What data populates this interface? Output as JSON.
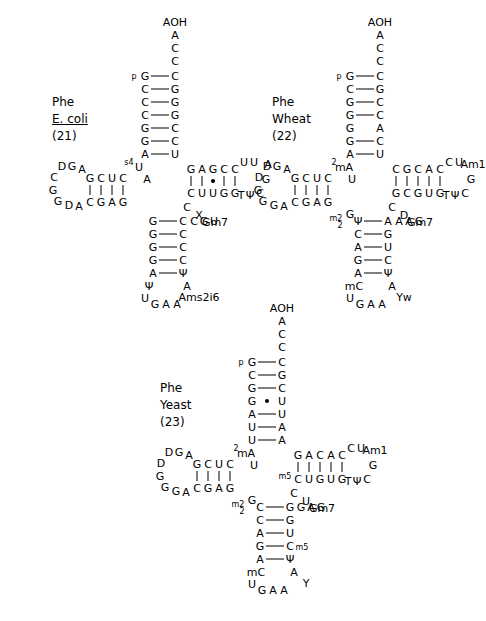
{
  "figure": {
    "panels": [
      {
        "id": "ecoli",
        "label_lines": [
          "Phe",
          "E. coli",
          "(21)"
        ],
        "label_underline_index": 1,
        "number": "(21)",
        "acceptor_end": "AOH",
        "acceptor_5p_tag": "p",
        "acceptor_stem_5p": [
          "G",
          "C",
          "C",
          "C",
          "G",
          "G",
          "A"
        ],
        "acceptor_stem_3p": [
          "C",
          "G",
          "G",
          "G",
          "C",
          "C",
          "U"
        ],
        "acceptor_single_3p": [
          "A",
          "C",
          "C"
        ],
        "acceptor_pair_marks": [
          "-",
          "-",
          "-",
          "-",
          "-",
          "-",
          "-"
        ],
        "d_arm_stem_top": [
          "C",
          "U",
          "C",
          "G"
        ],
        "d_arm_stem_bottom": [
          "G",
          "A",
          "G",
          "C"
        ],
        "d_loop": [
          "D",
          "G",
          "A",
          "C",
          "G",
          "G",
          "D",
          "A"
        ],
        "d_connect_5p": [
          "s4",
          "U",
          "A"
        ],
        "d_connect_3p": [
          "A"
        ],
        "t_arm_stem_top": [
          "G",
          "A",
          "G",
          "C",
          "C"
        ],
        "t_arm_stem_bottom": [
          "C",
          "U",
          "U",
          "G",
          "G"
        ],
        "t_arm_pair_marks": [
          "|",
          "|",
          "•",
          "|",
          "|"
        ],
        "t_loop": [
          "U",
          "U",
          "A",
          "G",
          "C",
          "Ψ",
          "T"
        ],
        "variable_loop": [
          "C",
          "X",
          "Gm7"
        ],
        "anticodon_connect": [
          "C",
          "G",
          "U"
        ],
        "anticodon_stem_left": [
          "G",
          "G",
          "G",
          "G",
          "A"
        ],
        "anticodon_stem_right": [
          "C",
          "C",
          "C",
          "C",
          "Ψ"
        ],
        "anticodon_loop": [
          "Ψ",
          "U",
          "G",
          "A",
          "A",
          "Ams2i6",
          "A"
        ],
        "anticodon": "GAA",
        "modifications": [
          "s4U",
          "D",
          "Gm7",
          "X",
          "T",
          "Ψ",
          "ms2i6A"
        ]
      },
      {
        "id": "wheat",
        "label_lines": [
          "Phe",
          "Wheat",
          "(22)"
        ],
        "label_underline_index": -1,
        "number": "(22)",
        "acceptor_end": "AOH",
        "acceptor_5p_tag": "p",
        "acceptor_stem_5p": [
          "G",
          "C",
          "G",
          "G",
          "G",
          "G",
          "A"
        ],
        "acceptor_stem_3p": [
          "C",
          "G",
          "C",
          "C",
          "A",
          "C",
          "U"
        ],
        "acceptor_single_3p": [
          "A",
          "C",
          "C"
        ],
        "acceptor_unpaired_index": 4,
        "d_arm_stem_top": [
          "C",
          "U",
          "C",
          "G"
        ],
        "d_arm_stem_bottom": [
          "G",
          "A",
          "G",
          "C"
        ],
        "d_loop": [
          "D",
          "G",
          "A",
          "D",
          "G",
          "G",
          "G",
          "A"
        ],
        "d_connect_5p": [
          "2",
          "mA",
          "U"
        ],
        "t_arm_stem_top": [
          "C",
          "G",
          "C",
          "A",
          "C"
        ],
        "t_arm_stem_bottom": [
          "G",
          "C",
          "G",
          "U",
          "G"
        ],
        "t_arm_pair_marks": [
          "|",
          "|",
          "|",
          "|",
          "|"
        ],
        "t_loop": [
          "C",
          "U",
          "Am1",
          "G",
          "C",
          "Ψ",
          "T"
        ],
        "variable_loop": [
          "C",
          "D",
          "Gm7"
        ],
        "anticodon_connect": [
          "A",
          "A",
          "G"
        ],
        "anticodon_stem_left": [
          "Ψ",
          "C",
          "A",
          "G",
          "A"
        ],
        "anticodon_stem_right": [
          "A",
          "G",
          "U",
          "C",
          "Ψ"
        ],
        "anticodon_loop": [
          "mC",
          "U",
          "G",
          "A",
          "A",
          "Yw",
          "A"
        ],
        "anticodon": "GAA",
        "m22G": "m2 2G",
        "modifications": [
          "m2A",
          "D",
          "Gm7",
          "Am1",
          "T",
          "Ψ",
          "m22G",
          "mC",
          "Yw"
        ]
      },
      {
        "id": "yeast",
        "label_lines": [
          "Phe",
          "Yeast",
          "(23)"
        ],
        "label_underline_index": -1,
        "number": "(23)",
        "acceptor_end": "AOH",
        "acceptor_5p_tag": "p",
        "acceptor_stem_5p": [
          "G",
          "C",
          "G",
          "G",
          "A",
          "U",
          "U"
        ],
        "acceptor_stem_3p": [
          "C",
          "G",
          "C",
          "U",
          "U",
          "A",
          "A"
        ],
        "acceptor_single_3p": [
          "A",
          "C",
          "C"
        ],
        "acceptor_wobble_index": 3,
        "d_arm_stem_top": [
          "C",
          "U",
          "C",
          "G"
        ],
        "d_arm_stem_bottom": [
          "G",
          "A",
          "G",
          "C"
        ],
        "d_loop": [
          "D",
          "G",
          "A",
          "D",
          "G",
          "G",
          "G",
          "A"
        ],
        "d_connect_5p": [
          "2",
          "mA",
          "U"
        ],
        "t_arm_stem_top": [
          "G",
          "A",
          "C",
          "A",
          "C"
        ],
        "t_arm_stem_bottom": [
          "C",
          "U",
          "G",
          "U",
          "G"
        ],
        "t_arm_prefix": "m5",
        "t_arm_pair_marks": [
          "|",
          "|",
          "|",
          "|",
          "|"
        ],
        "t_loop": [
          "C",
          "U",
          "Am1",
          "G",
          "C",
          "Ψ",
          "T"
        ],
        "variable_loop": [
          "C",
          "U",
          "Gm7"
        ],
        "anticodon_connect": [
          "G",
          "A",
          "G"
        ],
        "anticodon_stem_left": [
          "C",
          "C",
          "A",
          "G",
          "A"
        ],
        "anticodon_stem_right": [
          "G",
          "G",
          "U",
          "C",
          "Ψ"
        ],
        "anticodon_stem_right_mod": "Cm5",
        "anticodon_loop": [
          "mC",
          "U",
          "G",
          "A",
          "A",
          "Y",
          "A"
        ],
        "anticodon": "GAA",
        "m22G": "m2 2G",
        "modifications": [
          "m2A",
          "D",
          "Gm7",
          "Am1",
          "T",
          "Ψ",
          "m22G",
          "m5C",
          "Cm5",
          "Y"
        ]
      }
    ]
  }
}
